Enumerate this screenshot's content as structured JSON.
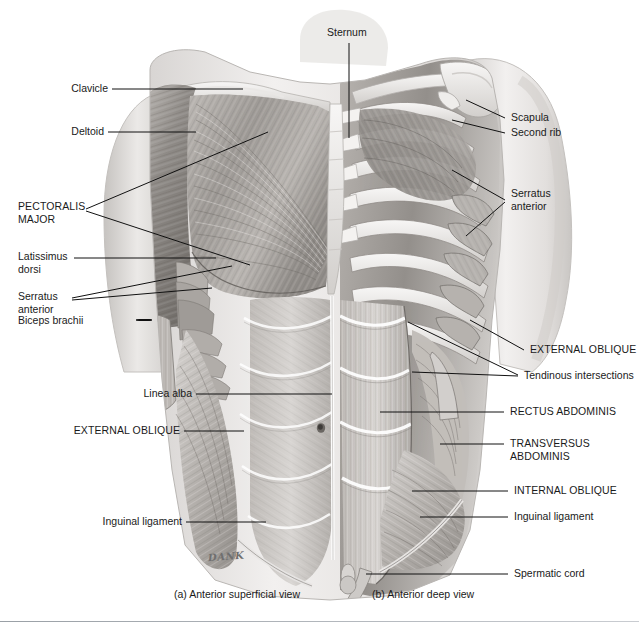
{
  "page": {
    "running_head": "CHAPTER 11   Muscles of the Shoulder",
    "width": 639,
    "height": 631,
    "background": "#ffffff",
    "leader_color": "#111111",
    "text_color": "#1a1a1a"
  },
  "figure": {
    "artist_signature": "DANK",
    "captions": [
      {
        "id": "caption-a",
        "text": "(a) Anterior superficial view"
      },
      {
        "id": "caption-b",
        "text": "(b) Anterior deep view"
      }
    ]
  },
  "labels": {
    "sternum": "Sternum",
    "clavicle": "Clavicle",
    "deltoid": "Deltoid",
    "pectoralis_major_line1": "PECTORALIS",
    "pectoralis_major_line2": "MAJOR",
    "latissimus_line1": "Latissimus",
    "latissimus_line2": "dorsi",
    "serratus_left_line1": "Serratus",
    "serratus_left_line2": "anterior",
    "biceps_brachii": "Biceps brachii",
    "linea_alba": "Linea alba",
    "external_oblique_left": "EXTERNAL OBLIQUE",
    "inguinal_ligament_left": "Inguinal ligament",
    "scapula": "Scapula",
    "second_rib": "Second rib",
    "serratus_right_line1": "Serratus",
    "serratus_right_line2": "anterior",
    "external_oblique_right": "EXTERNAL OBLIQUE",
    "tendinous_intersections": "Tendinous intersections",
    "rectus_abdominis": "RECTUS ABDOMINIS",
    "transversus_line1": "TRANSVERSUS",
    "transversus_line2": "ABDOMINIS",
    "internal_oblique": "INTERNAL OBLIQUE",
    "inguinal_ligament_right": "Inguinal ligament",
    "spermatic_cord": "Spermatic cord"
  },
  "palette": {
    "skin_light": "#eceaea",
    "skin_mid": "#d4d1cf",
    "muscle_light": "#cfcbc7",
    "muscle_mid": "#a9a5a1",
    "muscle_dark": "#7d7975",
    "bone_light": "#f2f0ee",
    "shadow": "#5f5c59",
    "highlight": "#fbfaf9"
  }
}
